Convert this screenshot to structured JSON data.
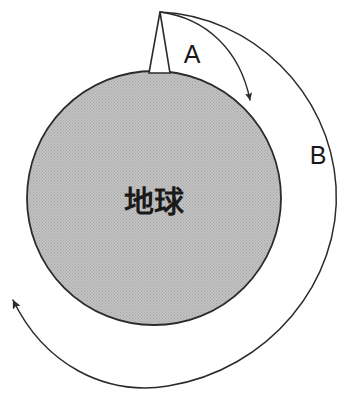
{
  "figure": {
    "type": "diagram",
    "title_text": "",
    "background_color": "#ffffff",
    "stroke_color": "#2b2b2b",
    "earth_fill_color": "#b9b9b9"
  },
  "earth": {
    "label": "地球",
    "label_meaning_icon": "earth-sphere",
    "center_x": 154,
    "center_y": 198,
    "radius": 127,
    "fill": "#b9b9b9",
    "stroke": "#2b2b2b"
  },
  "tower": {
    "name": "launch-tower",
    "apex_x": 160,
    "apex_y": 12,
    "base_left_x": 149,
    "base_right_x": 170,
    "base_y": 73,
    "fill": "#ffffff",
    "stroke": "#2b2b2b"
  },
  "trajectories": [
    {
      "id": "A",
      "label": "A",
      "label_x": 192,
      "label_y": 62,
      "description": "short ballistic arc falling back to earth surface",
      "start_x": 160,
      "start_y": 12,
      "end_x": 249,
      "end_y": 106,
      "arrowhead": "down-right",
      "stroke": "#2b2b2b"
    },
    {
      "id": "B",
      "label": "B",
      "label_x": 318,
      "label_y": 163,
      "description": "full orbital arc encircling the earth",
      "start_x": 160,
      "start_y": 12,
      "end_x": 11,
      "end_y": 297,
      "arrowhead": "up-left",
      "stroke": "#2b2b2b"
    }
  ],
  "labels": {
    "earth": "地球",
    "arc_a": "A",
    "arc_b": "B"
  }
}
